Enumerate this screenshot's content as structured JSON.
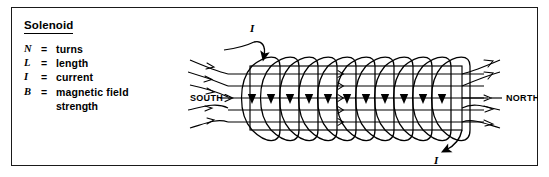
{
  "panel": {
    "title": "Solenoid",
    "legend": [
      {
        "symbol": "N",
        "equals": "=",
        "definition": "turns"
      },
      {
        "symbol": "L",
        "equals": "=",
        "definition": "length"
      },
      {
        "symbol": "I",
        "equals": "=",
        "definition": "current"
      },
      {
        "symbol": "B",
        "equals": "=",
        "definition": "magnetic field",
        "definition_cont": "strength"
      }
    ]
  },
  "diagram": {
    "name": "solenoid-field-diagram",
    "south_label": "SOUTH",
    "north_label": "NORTH",
    "current_in_label": "I",
    "current_out_label": "I",
    "turns_drawn": 11,
    "field_lines_drawn": 5,
    "stroke_color": "#000000",
    "background_color": "#ffffff"
  }
}
